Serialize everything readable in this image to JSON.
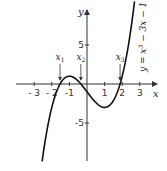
{
  "chart_data": {
    "type": "line",
    "function": "y = x^3 - 3x - 1",
    "equation_label": "y = x³ − 3x − 1",
    "xlabel": "x",
    "ylabel": "y",
    "x_ticks": [
      -3,
      -2,
      -1,
      1,
      2,
      3
    ],
    "x_tick_labels": [
      "- 3",
      "- 2",
      "-1",
      "1",
      "2",
      "3"
    ],
    "y_ticks": [
      5,
      -5
    ],
    "y_tick_labels": [
      "5",
      "-5"
    ],
    "xlim": [
      -3.5,
      4
    ],
    "ylim": [
      -10,
      11
    ],
    "x_range_plotted": [
      -2.55,
      2.7
    ],
    "grid": false,
    "local_max": {
      "x": -1,
      "y": 1
    },
    "local_min": {
      "x": 1,
      "y": -3
    },
    "roots": [
      {
        "label": "x",
        "sub": "1",
        "x": -1.53
      },
      {
        "label": "x",
        "sub": "2",
        "x": -0.35
      },
      {
        "label": "x",
        "sub": "3",
        "x": 1.88
      }
    ]
  },
  "colors": {
    "curve": "#111111",
    "axis": "#333333",
    "text": "#222222"
  },
  "layout": {
    "origin_x": 87,
    "origin_y": 84,
    "px_per_x": 17.6,
    "px_per_y": 7.8
  }
}
